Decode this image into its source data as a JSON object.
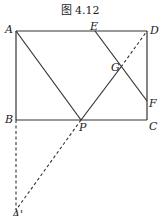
{
  "caption": "图 4.12",
  "colors": {
    "line": "#333333",
    "background": "#ffffff"
  },
  "points": {
    "A": {
      "label": "A",
      "x": 16,
      "y": 31
    },
    "B": {
      "label": "B",
      "x": 16,
      "y": 120
    },
    "C": {
      "label": "C",
      "x": 147,
      "y": 120
    },
    "D": {
      "label": "D",
      "x": 147,
      "y": 31
    },
    "E": {
      "label": "E",
      "x": 95,
      "y": 31
    },
    "F": {
      "label": "F",
      "x": 147,
      "y": 101
    },
    "G": {
      "label": "G",
      "x": 121,
      "y": 67
    },
    "P": {
      "label": "P",
      "x": 81,
      "y": 120
    },
    "A_prime": {
      "label": "A'",
      "x": 16,
      "y": 210
    }
  },
  "segments_solid": [
    "AD",
    "DC",
    "CB",
    "BA",
    "AP",
    "PG",
    "EF"
  ],
  "segments_dashed": [
    "GD",
    "BA'",
    "PA'"
  ]
}
